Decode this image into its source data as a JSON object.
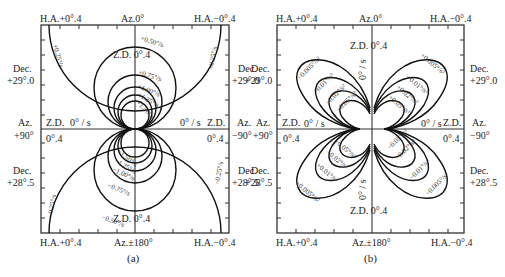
{
  "panels": [
    {
      "id": "a",
      "caption": "(a)",
      "top_left": "H.A.+0°.4",
      "top_center": "Az.0°",
      "top_right": "H.A.−0°.4",
      "bottom_left": "H.A.+0°.4",
      "bottom_center": "Az.±180°",
      "bottom_right": "H.A.−0°.4",
      "left_dec_top": [
        "Dec.",
        "+29°.0"
      ],
      "left_az": [
        "Az.",
        "+90°"
      ],
      "left_dec_bottom": [
        "Dec.",
        "+28°.5"
      ],
      "right_dec_top": [
        "Dec.",
        "+29°.0"
      ],
      "right_az": [
        "Az.",
        "−90°"
      ],
      "right_dec_bottom": [
        "Dec.",
        "+28°.5"
      ],
      "zd_top": "Z.D.  0°.4",
      "zd_bottom": "Z.D.  0°.4",
      "zd_left": "Z.D.",
      "zd_right": "Z.D.",
      "zero_left": "0° / s",
      "zero_right": "0° / s",
      "deg_left": "0°.4",
      "deg_right": "0°.4",
      "contours_positive": [
        "+0.25°/s",
        "+0.50°/s",
        "+0.75°/s",
        "+1.00°/s",
        "+1.25°/s",
        "+1.50°/s"
      ],
      "contours_negative": [
        "−0.25°/s",
        "−0.50°/s",
        "−0.75°/s",
        "−1.00°/s",
        "−1.25°/s",
        "−1.50°/s"
      ],
      "labels": {
        "p025_left": "+0.25°/s",
        "p025_right": "+0.25°/s",
        "p050": "+0.50°/s",
        "p075": "+0.75°/s",
        "p100": "+1.00°/s",
        "p125": "+1.25°/s",
        "p150": "+1.50°/s",
        "m025_left": "−0.25°/s",
        "m025_right": "−0.25°/s",
        "m050": "−0.50°/s",
        "m075": "−0.75°/s",
        "m100": "−1.00°/s",
        "m125": "−1.25°/s",
        "m150": "−1.50°/s"
      }
    },
    {
      "id": "b",
      "caption": "(b)",
      "top_left": "H.A.+0°.4",
      "top_center": "Az.0°",
      "top_right": "H.A.−0°.4",
      "bottom_left": "H.A.+0°.4",
      "bottom_center": "Az.±180°",
      "bottom_right": "H.A.−0°.4",
      "left_dec_top": [
        "Dec.",
        "+29°.0"
      ],
      "left_az": [
        "Az.",
        "+90°"
      ],
      "left_dec_bottom": [
        "Dec.",
        "+28°.5"
      ],
      "right_dec_top": [
        "Dec.",
        "+29°.0"
      ],
      "right_az": [
        "Az.",
        "−90°"
      ],
      "right_dec_bottom": [
        "Dec.",
        "+28°.5"
      ],
      "zd_top": "Z.D.  0°.4",
      "zd_bottom": "Z.D.  0°.4",
      "zd_left": "Z.D.",
      "zd_right": "Z.D.",
      "zero_left": "0° / s",
      "zero_right": "0° / s",
      "zero_vert_top": "0° / s",
      "zero_vert_bottom": "0° / s",
      "deg_left": "0°.4",
      "deg_right": "0°.4",
      "labels": {
        "ul_0005": "−0.005°/s²",
        "ul_001": "−0.01°/s²",
        "ul_002": "−0.02°/s²",
        "ul_005": "−0.05°/s²",
        "ur_0005": "+0.005°/s²",
        "ur_001": "+0.01°/s²",
        "ur_002": "+0.02°/s²",
        "ur_005": "+0.05°/s²",
        "ll_0005": "+0.005°/s²",
        "ll_001": "+0.01°/s²",
        "ll_002": "+0.02°/s²",
        "ll_005": "+0.05°/s²",
        "lr_0005": "−0.005°/s²",
        "lr_001": "−0.01°/s²",
        "lr_002": "−0.02°/s²",
        "lr_005": "−0.05°/s²"
      }
    }
  ]
}
